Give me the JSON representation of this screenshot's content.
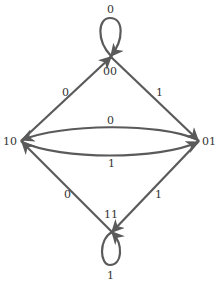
{
  "diagram": {
    "type": "state-transition",
    "stroke_color": "#5a5a5a",
    "nodes": [
      {
        "id": "00",
        "label": "00"
      },
      {
        "id": "01",
        "label": "01"
      },
      {
        "id": "10",
        "label": "10"
      },
      {
        "id": "11",
        "label": "11"
      }
    ],
    "edges": [
      {
        "from": "00",
        "to": "00",
        "label": "0"
      },
      {
        "from": "00",
        "to": "01",
        "label": "1"
      },
      {
        "from": "01",
        "to": "10",
        "label": "0"
      },
      {
        "from": "10",
        "to": "01",
        "label": "1"
      },
      {
        "from": "10",
        "to": "00",
        "label": "0"
      },
      {
        "from": "01",
        "to": "11",
        "label": "1"
      },
      {
        "from": "11",
        "to": "10",
        "label": "0"
      },
      {
        "from": "11",
        "to": "11",
        "label": "1"
      }
    ]
  }
}
